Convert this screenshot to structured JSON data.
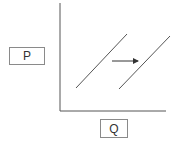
{
  "diagram": {
    "type": "supply-curve-shift",
    "y_axis_label": "P",
    "x_axis_label": "Q",
    "curves": [
      {
        "name": "original-curve",
        "x1": 76,
        "y1": 88,
        "x2": 127,
        "y2": 34
      },
      {
        "name": "shifted-curve",
        "x1": 119,
        "y1": 89,
        "x2": 170,
        "y2": 36
      }
    ],
    "arrow": {
      "direction": "right",
      "x1": 112,
      "y1": 61,
      "x2": 138,
      "y2": 61
    },
    "colors": {
      "axis": "#555555",
      "curve": "#555555",
      "arrow": "#333333",
      "box_border": "#8a8a8a"
    }
  }
}
